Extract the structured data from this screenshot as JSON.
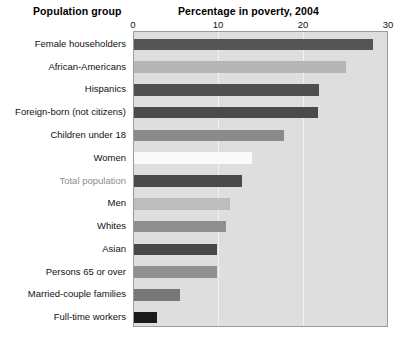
{
  "header": {
    "group_label": "Population group",
    "chart_title": "Percentage in poverty, 2004"
  },
  "axis": {
    "ticks": [
      "0",
      "10",
      "20",
      "30"
    ]
  },
  "chart_data": {
    "type": "bar",
    "orientation": "horizontal",
    "title": "Percentage in poverty, 2004",
    "xlabel": "Percentage in poverty, 2004",
    "ylabel": "Population group",
    "xlim": [
      0,
      30
    ],
    "xticks": [
      0,
      10,
      20,
      30
    ],
    "grid": true,
    "legend": "none",
    "categories": [
      "Female householders",
      "African-Americans",
      "Hispanics",
      "Foreign-born (not citizens)",
      "Children under 18",
      "Women",
      "Total population",
      "Men",
      "Whites",
      "Asian",
      "Persons 65 or over",
      "Married-couple families",
      "Full-time workers"
    ],
    "values": [
      28.1,
      24.9,
      21.8,
      21.6,
      17.7,
      13.9,
      12.7,
      11.3,
      10.8,
      9.8,
      9.8,
      5.4,
      2.7
    ],
    "bar_colors": [
      "#555555",
      "#b5b5b5",
      "#4f4f4f",
      "#4a4a4a",
      "#8a8a8a",
      "#fafafa",
      "#4a4a4a",
      "#bdbdbd",
      "#8f8f8f",
      "#484848",
      "#909090",
      "#777777",
      "#1a1a1a"
    ],
    "highlight_category": "Total population",
    "plot_background": "#dedede",
    "grid_color": "#f2f2f2"
  }
}
